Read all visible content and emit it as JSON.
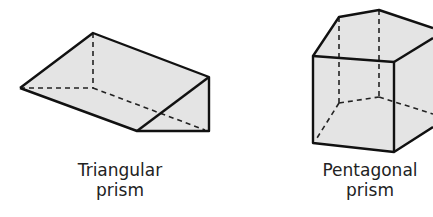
{
  "figures": [
    {
      "name": "Triangular prism",
      "label_lines": [
        "Triangular",
        "prism"
      ],
      "fill": "#e4e4e4",
      "stroke": "#111111"
    },
    {
      "name": "Pentagonal prism",
      "label_lines": [
        "Pentagonal",
        "prism"
      ],
      "fill": "#e4e4e4",
      "stroke": "#111111"
    }
  ]
}
